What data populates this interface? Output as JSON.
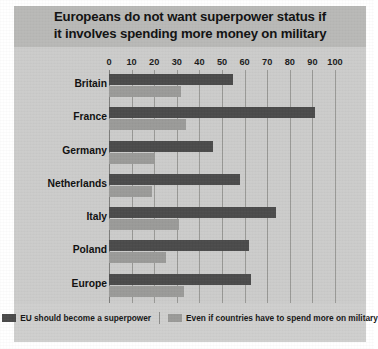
{
  "title": {
    "line1": "Europeans do not want superpower status if",
    "line2": "it involves spending more money on military"
  },
  "legend": {
    "series1": "EU should become a superpower",
    "series2": "Even if countries have to spend more on military"
  },
  "colors": {
    "series1": "#4b4b4b",
    "series2": "#9b9b99",
    "plot_background": "#cccccb",
    "title_background": "#b9b9b7",
    "gridline": "#8f8f8d"
  },
  "chart_data": {
    "type": "bar",
    "orientation": "horizontal",
    "title": "Europeans do not want superpower status if it involves spending more money on military",
    "xlabel": "",
    "ylabel": "",
    "xlim": [
      0,
      100
    ],
    "xticks": [
      0,
      10,
      20,
      30,
      40,
      50,
      60,
      70,
      80,
      90,
      100
    ],
    "grid": true,
    "legend_position": "bottom",
    "categories": [
      "Britain",
      "France",
      "Germany",
      "Netherlands",
      "Italy",
      "Poland",
      "Europe"
    ],
    "series": [
      {
        "name": "EU should become a superpower",
        "color": "#4b4b4b",
        "values": [
          55,
          91,
          46,
          58,
          74,
          62,
          63
        ]
      },
      {
        "name": "Even if countries have to spend more on military",
        "color": "#9b9b99",
        "values": [
          32,
          34,
          20,
          19,
          31,
          25,
          33
        ]
      }
    ]
  }
}
